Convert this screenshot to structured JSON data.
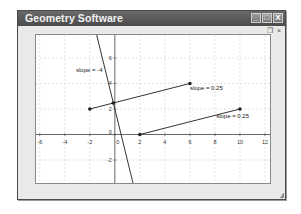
{
  "window": {
    "title": "Geometry Software",
    "controls": {
      "minimize": "_",
      "maximize": "□",
      "close": "X"
    },
    "mdi_controls": {
      "minimize": "_",
      "restore": "❐",
      "close": "×"
    }
  },
  "chart_data": {
    "type": "line",
    "title": "",
    "xlabel": "",
    "ylabel": "",
    "xlim": [
      -6.3,
      12.4
    ],
    "ylim": [
      -3.8,
      7.8
    ],
    "grid": true,
    "grid_step": 2,
    "x_ticks": [
      "-6",
      "-4",
      "-2",
      "0",
      "2",
      "4",
      "6",
      "8",
      "10",
      "12"
    ],
    "y_ticks": [
      "6",
      "4",
      "2",
      "0",
      "-2"
    ],
    "series": [
      {
        "name": "line slope -4",
        "kind": "line",
        "equation": "y = -4x + 2",
        "points": [
          [
            -1.45,
            7.8
          ],
          [
            1.45,
            -3.8
          ]
        ]
      },
      {
        "name": "segment A",
        "kind": "segment",
        "points": [
          [
            -2,
            2
          ],
          [
            6,
            4
          ]
        ]
      },
      {
        "name": "segment B",
        "kind": "segment",
        "points": [
          [
            2,
            0
          ],
          [
            10,
            2
          ]
        ]
      }
    ],
    "points": [
      [
        -2,
        2
      ],
      [
        6,
        4
      ],
      [
        2,
        0
      ],
      [
        10,
        2
      ],
      [
        -0.12,
        2.47
      ]
    ],
    "annotations": [
      {
        "text": "slope = -4",
        "x": -3.1,
        "y": 4.9
      },
      {
        "text": "slope = 0.25",
        "x": 6.0,
        "y": 3.5
      },
      {
        "text": "slope = 0.25",
        "x": 8.1,
        "y": 1.3
      }
    ]
  }
}
